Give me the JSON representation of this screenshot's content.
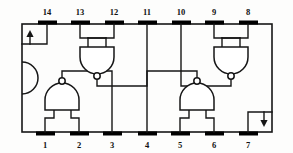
{
  "diagram": {
    "type": "ic-pinout-schematic",
    "device": "quad 2-input NAND gate DIP-14",
    "package": {
      "pin_count": 14,
      "body": {
        "x": 22,
        "y": 24,
        "width": 250,
        "height": 108
      },
      "notch": "left-side-semicircle",
      "notch_label": "pin-1-orientation-notch"
    },
    "colors": {
      "line": "#161616",
      "pin_pad": "#000000",
      "background": "#ffffff",
      "text": "#111111"
    },
    "pins_top": [
      {
        "number": "14",
        "x": 47
      },
      {
        "number": "13",
        "x": 80
      },
      {
        "number": "12",
        "x": 114
      },
      {
        "number": "11",
        "x": 147
      },
      {
        "number": "10",
        "x": 181
      },
      {
        "number": "9",
        "x": 214
      },
      {
        "number": "8",
        "x": 248
      }
    ],
    "pins_bottom": [
      {
        "number": "1",
        "x": 45
      },
      {
        "number": "2",
        "x": 79
      },
      {
        "number": "3",
        "x": 112
      },
      {
        "number": "4",
        "x": 147
      },
      {
        "number": "5",
        "x": 180
      },
      {
        "number": "6",
        "x": 214
      },
      {
        "number": "7",
        "x": 248
      }
    ],
    "power": {
      "vcc_pin": "14",
      "vcc_marker": "up-arrow",
      "gnd_pin": "7",
      "gnd_marker": "down-arrow"
    },
    "gates": [
      {
        "id": "gate-a",
        "position": "bottom-left",
        "orientation": "output-up",
        "inputs": [
          "1",
          "2"
        ],
        "output": "3"
      },
      {
        "id": "gate-b",
        "position": "top-left",
        "orientation": "output-down",
        "inputs": [
          "13",
          "12"
        ],
        "output": "11"
      },
      {
        "id": "gate-c",
        "position": "bottom-right",
        "orientation": "output-up",
        "inputs": [
          "5",
          "6"
        ],
        "output": "4"
      },
      {
        "id": "gate-d",
        "position": "top-right",
        "orientation": "output-down",
        "inputs": [
          "9",
          "8"
        ],
        "output": "10"
      }
    ]
  }
}
